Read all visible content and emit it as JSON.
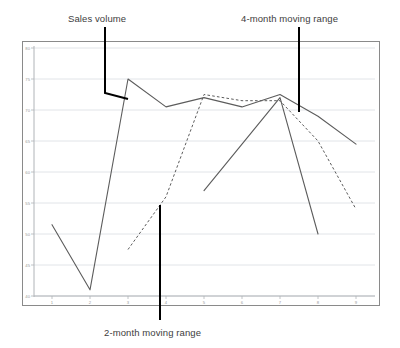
{
  "chart_data": {
    "type": "line",
    "title": "",
    "xlabel": "",
    "ylabel": "",
    "x": [
      1,
      2,
      3,
      4,
      5,
      6,
      7,
      8,
      9
    ],
    "xtick_labels": [
      "1",
      "2",
      "3",
      "4",
      "5",
      "6",
      "7",
      "8",
      "9"
    ],
    "ytick_labels": [
      "40",
      "45",
      "50",
      "55",
      "60",
      "65",
      "70",
      "75",
      "80"
    ],
    "yticks": [
      40,
      45,
      50,
      55,
      60,
      65,
      70,
      75,
      80
    ],
    "ylim": [
      40,
      80
    ],
    "xlim": [
      0.5,
      9.5
    ],
    "grid": "horizontal",
    "legend": "none",
    "series": [
      {
        "name": "Sales volume",
        "style": "solid",
        "color": "#595959",
        "x": [
          1,
          2,
          3,
          4,
          5,
          6,
          7,
          8,
          9
        ],
        "values": [
          51.5,
          41.0,
          75.0,
          70.5,
          72.0,
          70.5,
          72.5,
          69.0,
          64.5
        ]
      },
      {
        "name": "2-month moving range",
        "style": "dashed",
        "color": "#595959",
        "x": [
          3,
          4,
          5,
          6,
          7,
          8,
          9
        ],
        "values": [
          47.5,
          56.0,
          72.5,
          71.5,
          71.5,
          65.0,
          54.0
        ]
      },
      {
        "name": "4-month moving range",
        "style": "solid",
        "color": "#595959",
        "x": [
          5,
          6,
          7,
          8
        ],
        "values": [
          57.0,
          64.5,
          72.0,
          50.0
        ]
      }
    ],
    "annotations": [
      {
        "name": "sales-volume",
        "text": "Sales volume",
        "label_x": 68,
        "label_y": 13,
        "leader": "M 105 27 L 105 93 L 128 99"
      },
      {
        "name": "4-month-moving-range",
        "text": "4-month moving range",
        "label_x": 241,
        "label_y": 13,
        "leader": "M 299 27 L 299 112"
      },
      {
        "name": "2-month-moving-range",
        "text": "2-month moving range",
        "label_x": 104,
        "label_y": 327,
        "leader": "M 160 205 L 160 320"
      }
    ]
  },
  "annotations": {
    "sales_volume": "Sales volume",
    "four_month": "4-month moving range",
    "two_month": "2-month moving range"
  },
  "axes": {
    "ytick_labels": [
      "80",
      "75",
      "70",
      "65",
      "60",
      "55",
      "50",
      "45",
      "40"
    ],
    "xtick_labels": [
      "1",
      "2",
      "3",
      "4",
      "5",
      "6",
      "7",
      "8",
      "9"
    ]
  }
}
